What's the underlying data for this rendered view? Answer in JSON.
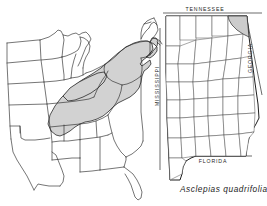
{
  "figure": {
    "caption": "Asclepias quadrifolia",
    "background_color": "#ffffff",
    "line_color": "#2b2b2b",
    "shade_color": "#d2d2d2"
  },
  "regional_map": {
    "name": "eastern-united-states-range-map",
    "shading_legend": "shaded = species distribution range",
    "shaded_states": [
      "Alabama",
      "Georgia",
      "Tennessee",
      "Kentucky",
      "North Carolina",
      "South Carolina",
      "Virginia",
      "West Virginia",
      "Maryland",
      "Delaware",
      "Pennsylvania",
      "New Jersey",
      "New York",
      "Connecticut",
      "Rhode Island",
      "Massachusetts",
      "Ohio",
      "Indiana",
      "Missouri",
      "Arkansas"
    ],
    "unshaded_states": [
      "North Dakota",
      "South Dakota",
      "Nebraska",
      "Kansas",
      "Oklahoma",
      "Texas",
      "Minnesota",
      "Iowa",
      "Wisconsin",
      "Illinois",
      "Michigan",
      "Louisiana",
      "Mississippi",
      "Florida",
      "Vermont",
      "New Hampshire",
      "Maine"
    ]
  },
  "state_map": {
    "name": "alabama-county-map",
    "state": "Alabama",
    "shaded_counties": [
      "Jackson"
    ],
    "labels": {
      "north": "TENNESSEE",
      "west": "MISSISSIPPI",
      "east": "GEORGIA",
      "south": "FLORIDA"
    }
  }
}
